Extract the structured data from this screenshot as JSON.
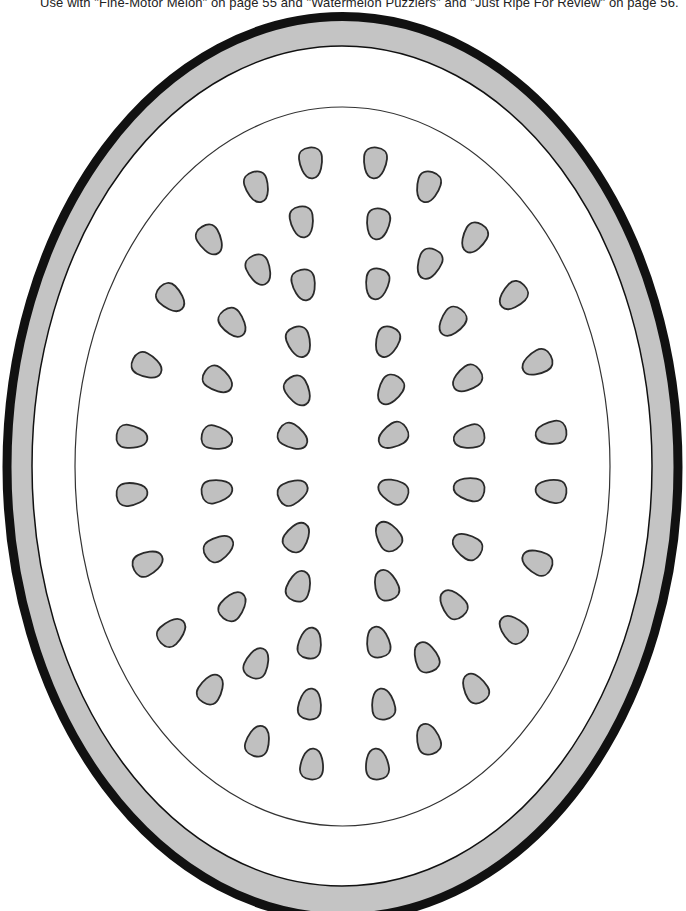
{
  "caption": {
    "text": "Use with \"Fine-Motor Melon\" on page 55 and \"Watermelon Puzzlers\" and \"Just Ripe For Review\" on page 56."
  },
  "colors": {
    "outline": "#111111",
    "rind": "#c4c4c4",
    "flesh": "#ffffff",
    "seed_fill": "#c0c0c0",
    "seed_stroke": "#2a2a2a",
    "inner_line": "#333333"
  },
  "watermelon": {
    "center": [
      342.5,
      467
    ],
    "outer": {
      "rx": 340,
      "ry": 455,
      "stroke_width": 9
    },
    "rind_inner": {
      "cx": 342,
      "cy": 466,
      "rx": 310,
      "ry": 420
    },
    "flesh_line": {
      "cx": 342.5,
      "cy": 466.5,
      "rx": 267.5,
      "ry": 359.5
    },
    "seed_size": {
      "rx": 11.5,
      "ry": 15.5
    }
  },
  "seeds": [
    {
      "x": 311,
      "y": 163
    },
    {
      "x": 375,
      "y": 163
    },
    {
      "x": 257,
      "y": 187
    },
    {
      "x": 428,
      "y": 187
    },
    {
      "x": 302,
      "y": 222
    },
    {
      "x": 378,
      "y": 224
    },
    {
      "x": 210,
      "y": 240
    },
    {
      "x": 474,
      "y": 238
    },
    {
      "x": 259,
      "y": 270
    },
    {
      "x": 429,
      "y": 264
    },
    {
      "x": 304,
      "y": 285
    },
    {
      "x": 377,
      "y": 284
    },
    {
      "x": 171,
      "y": 298
    },
    {
      "x": 513,
      "y": 296
    },
    {
      "x": 233,
      "y": 323
    },
    {
      "x": 452,
      "y": 322
    },
    {
      "x": 299,
      "y": 342
    },
    {
      "x": 387,
      "y": 342
    },
    {
      "x": 147,
      "y": 366
    },
    {
      "x": 537,
      "y": 363
    },
    {
      "x": 218,
      "y": 380
    },
    {
      "x": 467,
      "y": 379
    },
    {
      "x": 298,
      "y": 391
    },
    {
      "x": 390,
      "y": 390
    },
    {
      "x": 132,
      "y": 437
    },
    {
      "x": 551,
      "y": 433
    },
    {
      "x": 217,
      "y": 438
    },
    {
      "x": 469,
      "y": 437
    },
    {
      "x": 293,
      "y": 437
    },
    {
      "x": 393,
      "y": 436
    },
    {
      "x": 132,
      "y": 494
    },
    {
      "x": 551,
      "y": 491
    },
    {
      "x": 217,
      "y": 491
    },
    {
      "x": 469,
      "y": 489
    },
    {
      "x": 293,
      "y": 492
    },
    {
      "x": 393,
      "y": 491
    },
    {
      "x": 148,
      "y": 563
    },
    {
      "x": 537,
      "y": 562
    },
    {
      "x": 219,
      "y": 548
    },
    {
      "x": 467,
      "y": 546
    },
    {
      "x": 297,
      "y": 537
    },
    {
      "x": 388,
      "y": 536
    },
    {
      "x": 172,
      "y": 632
    },
    {
      "x": 513,
      "y": 629
    },
    {
      "x": 233,
      "y": 606
    },
    {
      "x": 453,
      "y": 604
    },
    {
      "x": 299,
      "y": 586
    },
    {
      "x": 386,
      "y": 585
    },
    {
      "x": 211,
      "y": 689
    },
    {
      "x": 475,
      "y": 688
    },
    {
      "x": 257,
      "y": 663
    },
    {
      "x": 426,
      "y": 657
    },
    {
      "x": 310,
      "y": 643
    },
    {
      "x": 378,
      "y": 642
    },
    {
      "x": 258,
      "y": 741
    },
    {
      "x": 428,
      "y": 739
    },
    {
      "x": 310,
      "y": 704
    },
    {
      "x": 383,
      "y": 704
    },
    {
      "x": 312,
      "y": 764
    },
    {
      "x": 377,
      "y": 764
    }
  ]
}
